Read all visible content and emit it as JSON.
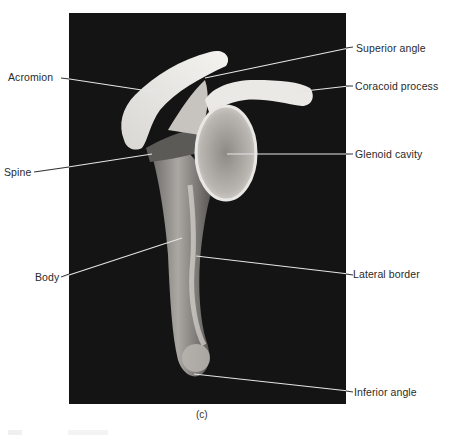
{
  "figure": {
    "panel_caption": "(c)",
    "labels_left": [
      {
        "id": "acromion",
        "text": "Acromion"
      },
      {
        "id": "spine",
        "text": "Spine"
      },
      {
        "id": "body",
        "text": "Body"
      }
    ],
    "labels_right": [
      {
        "id": "superior-angle",
        "text": "Superior angle"
      },
      {
        "id": "coracoid-process",
        "text": "Coracoid process"
      },
      {
        "id": "glenoid-cavity",
        "text": "Glenoid cavity"
      },
      {
        "id": "lateral-border",
        "text": "Lateral border"
      },
      {
        "id": "inferior-angle",
        "text": "Inferior angle"
      }
    ],
    "colors": {
      "photo_background": "#141414",
      "bone_light": "#e8e6e2",
      "bone_mid": "#a9a7a3",
      "leader_line": "#e6e6e6",
      "label_text": "#2a2a2a"
    }
  }
}
